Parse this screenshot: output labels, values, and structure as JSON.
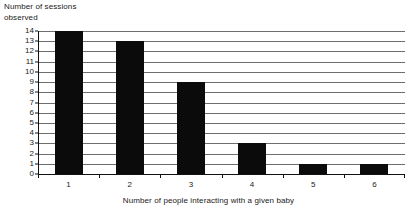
{
  "chart_data": {
    "type": "bar",
    "title": "",
    "xlabel": "Number of people interacting with a given baby",
    "ylabel": "Number of sessions\nobserved",
    "categories": [
      "1",
      "2",
      "3",
      "4",
      "5",
      "6"
    ],
    "values": [
      14,
      13,
      9,
      3,
      1,
      1
    ],
    "series": [
      {
        "name": "Number of sessions observed",
        "values": [
          14,
          13,
          9,
          3,
          1,
          1
        ]
      }
    ],
    "ylim": [
      0,
      14
    ],
    "ytick_step": 1,
    "yticks": [
      "14",
      "13",
      "12",
      "11",
      "10",
      "9",
      "8",
      "7",
      "6",
      "5",
      "4",
      "3",
      "2",
      "1",
      "0"
    ],
    "xticks": [
      "1",
      "2",
      "3",
      "4",
      "5",
      "6"
    ],
    "grid": true,
    "grid_axis": "y",
    "legend": false,
    "legend_position": "none",
    "bar_color": "#0b0b0b",
    "grid_color": "#6e6e6e",
    "axis_color": "#111111",
    "background_color": "#ffffff"
  }
}
